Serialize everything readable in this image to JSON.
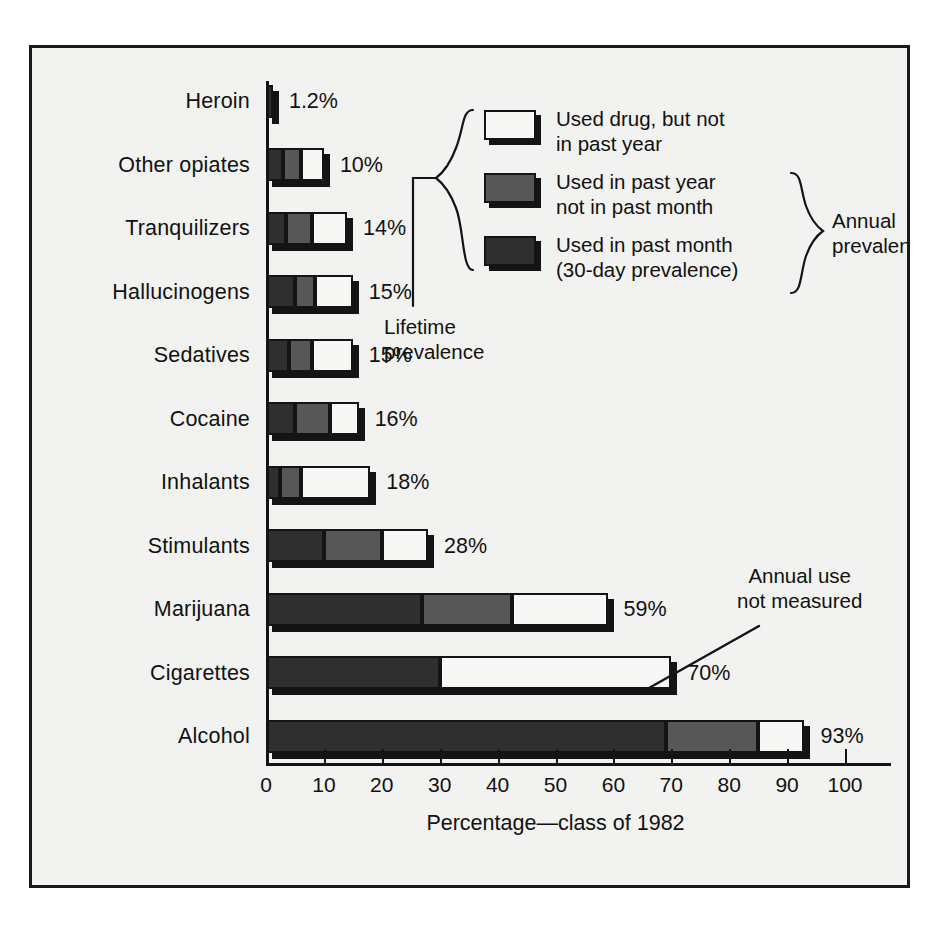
{
  "chart_data": {
    "type": "bar",
    "orientation": "horizontal",
    "stacked": true,
    "title": "",
    "xlabel": "Percentage—class of 1982",
    "ylabel": "",
    "xlim": [
      0,
      108
    ],
    "xticks": [
      0,
      10,
      20,
      30,
      40,
      50,
      60,
      70,
      80,
      90,
      100
    ],
    "grid": false,
    "legend_position": "inside-upper-right",
    "categories": [
      "Heroin",
      "Other opiates",
      "Tranquilizers",
      "Hallucinogens",
      "Sedatives",
      "Cocaine",
      "Inhalants",
      "Stimulants",
      "Marijuana",
      "Cigarettes",
      "Alcohol"
    ],
    "series": [
      {
        "name": "Used in past month (30-day prevalence)",
        "key": "past_month",
        "color": "#2f2f2f",
        "values": [
          1.2,
          3.0,
          3.5,
          5.0,
          4.0,
          5.0,
          2.5,
          10.0,
          27.0,
          30.0,
          69.0
        ]
      },
      {
        "name": "Used in past year not in past month",
        "key": "past_year_not_month",
        "color": "#575757",
        "values": [
          0,
          3.0,
          4.5,
          3.5,
          4.0,
          6.0,
          3.5,
          10.0,
          15.5,
          0,
          16.0
        ]
      },
      {
        "name": "Used drug, but not in past year",
        "key": "not_past_year",
        "color": "#f7f7f5",
        "values": [
          0,
          4.0,
          6.0,
          6.5,
          7.0,
          5.0,
          12.0,
          8.0,
          16.5,
          40.0,
          8.0
        ]
      }
    ],
    "totals": [
      1.2,
      10,
      14,
      15,
      15,
      16,
      18,
      28,
      59,
      70,
      93
    ],
    "value_labels": [
      "1.2%",
      "10%",
      "14%",
      "15%",
      "15%",
      "16%",
      "18%",
      "28%",
      "59%",
      "70%",
      "93%"
    ],
    "annotations": [
      {
        "name": "annual-use-not-measured",
        "lines": [
          "Annual use",
          "not measured"
        ],
        "points_at": "Cigarettes"
      },
      {
        "name": "lifetime-prevalence",
        "lines": [
          "Lifetime",
          "prevalence"
        ]
      },
      {
        "name": "annual-prevalence",
        "lines": [
          "Annual",
          "prevalence"
        ]
      }
    ]
  },
  "legend": {
    "items": [
      {
        "swatch": "white",
        "lines": [
          "Used drug, but not",
          "in past year"
        ]
      },
      {
        "swatch": "gray",
        "lines": [
          "Used in past year",
          "not in past month"
        ]
      },
      {
        "swatch": "dark",
        "lines": [
          "Used in past month",
          "(30-day prevalence)"
        ]
      }
    ],
    "lifetime_label_line1": "Lifetime",
    "lifetime_label_line2": "prevalence",
    "annual_label_line1": "Annual",
    "annual_label_line2": "prevalence"
  },
  "annotation": {
    "line1": "Annual use",
    "line2": "not measured"
  },
  "axis": {
    "title": "Percentage—class of 1982",
    "ticks": [
      "0",
      "10",
      "20",
      "30",
      "40",
      "50",
      "60",
      "70",
      "80",
      "90",
      "100"
    ]
  },
  "colors": {
    "past_month": "#2f2f2f",
    "past_year_not_month": "#575757",
    "not_past_year": "#f7f7f5",
    "ink": "#141414",
    "panel": "#f2f2f0"
  }
}
